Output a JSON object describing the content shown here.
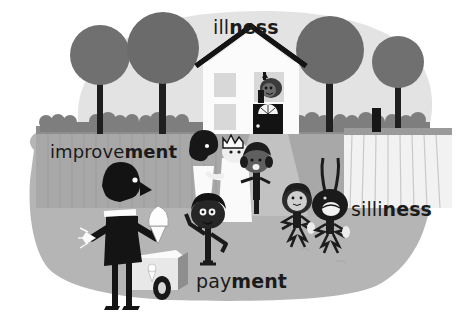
{
  "image": {
    "title": "Illustrated neighbourhood scene with four word labels",
    "width": 456,
    "height": 325,
    "style": "flat mid-century style vector illustration, greyscale",
    "background_color": "#ffffff"
  },
  "labels": [
    {
      "name": "illness",
      "light_part": "ill",
      "bold_part": "ness",
      "full_text": "illness",
      "position": "top-center, above house roof",
      "color": "#1b1b1b"
    },
    {
      "name": "improvement",
      "light_part": "improve",
      "bold_part": "ment",
      "full_text": "improvement",
      "position": "mid-left, over fence",
      "color": "#1b1b1b"
    },
    {
      "name": "silliness",
      "light_part": "silli",
      "bold_part": "ness",
      "full_text": "silliness",
      "position": "right, beside bunny-eared figure",
      "color": "#1b1b1b"
    },
    {
      "name": "payment",
      "light_part": "pay",
      "bold_part": "ment",
      "full_text": "payment",
      "position": "bottom-center, beside ice-cream cart",
      "color": "#1b1b1b"
    }
  ],
  "palette": {
    "page_white": "#ffffff",
    "sky_blob": "#e2e2e2",
    "ground_blob": "#b4b4b4",
    "fence_light": "#c9c9c9",
    "fence_rail": "#9a9a9a",
    "tree_canopy": "#6e6e6e",
    "tree_trunk": "#1f1f1f",
    "hedge": "#8a8a8a",
    "house_wall": "#fbfbfb",
    "house_roof": "#141414",
    "house_window": "#d6d6d6",
    "door_dark": "#141414",
    "path_gray": "#c3c3c3",
    "figure_dark": "#171717",
    "figure_white": "#fafafa",
    "skin_mid": "#6b6b6b",
    "cart_body": "#efefef",
    "cart_side": "#8f8f8f",
    "picket_white": "#f4f4f4",
    "label_text": "#1b1b1b"
  },
  "scene": {
    "house": {
      "name": "white-house",
      "roof": "dark gabled roof",
      "windows": 3,
      "door": "dark door with white fan light",
      "occupant": "person waving from upper window"
    },
    "trees": {
      "name": "round-trees",
      "count": 4,
      "description": "dark round canopies with fanned branch trunks"
    },
    "hedge": {
      "name": "hedge-row",
      "description": "row of scalloped bushes along the back fence"
    },
    "fence_left": {
      "name": "left-fence",
      "description": "grey vertical plank fence behind improvement label"
    },
    "fence_right": {
      "name": "picket-fence",
      "description": "white picket fence at right of garden"
    },
    "figures": [
      {
        "name": "ice-cream-vendor",
        "description": "tall dark-suited vendor holding an ice-cream cone"
      },
      {
        "name": "ice-cream-cart",
        "description": "light cart on one dark wheel with cone emblem"
      },
      {
        "name": "adult-dark-figure",
        "description": "adult in white with dark head, facing right"
      },
      {
        "name": "crowned-figure",
        "description": "figure in white robe with white crown"
      },
      {
        "name": "child-pigtails",
        "description": "dark child with pigtails standing on the path"
      },
      {
        "name": "child-waving",
        "description": "dark-haired child with raised arm, front centre"
      },
      {
        "name": "creature-round-head",
        "description": "small round-headed creature with spiky limbs"
      },
      {
        "name": "bunny-eared-figure",
        "description": "dark figure with tall bunny ears, open mouth"
      }
    ]
  }
}
